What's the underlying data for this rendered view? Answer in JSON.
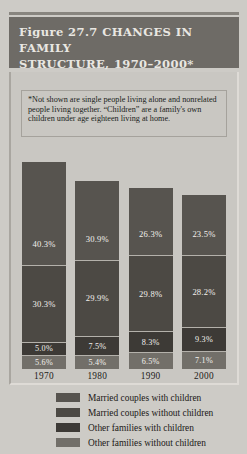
{
  "figure": {
    "title_line1": "Figure 27.7  CHANGES IN FAMILY",
    "title_line2": "STRUCTURE, 1970–2000*",
    "footnote": "*Not shown are single people living alone and nonrelated people living together. “Children” are a family's own children under age eighteen living at home."
  },
  "colors": {
    "banner": "#6e6b66",
    "panel_background": "#c9c7c2",
    "page_background": "#cdcbc6",
    "series_0": "#57544f",
    "series_1": "#4c4944",
    "series_2": "#3d3a36",
    "series_3": "#726f69"
  },
  "legend": {
    "items": [
      {
        "label": "Married couples with children",
        "swatch": "#57544f"
      },
      {
        "label": "Married couples without children",
        "swatch": "#4c4944"
      },
      {
        "label": "Other families with children",
        "swatch": "#3d3a36"
      },
      {
        "label": "Other families without children",
        "swatch": "#726f69"
      }
    ]
  },
  "chart_data": {
    "type": "bar",
    "title": "Figure 27.7  CHANGES IN FAMILY STRUCTURE, 1970–2000*",
    "xlabel": "",
    "ylabel": "",
    "ylim": [
      0,
      100
    ],
    "grid": false,
    "stacked": true,
    "legend_position": "bottom",
    "categories": [
      "1970",
      "1980",
      "1990",
      "2000"
    ],
    "series": [
      {
        "name": "Married couples with children",
        "values": [
          40.3,
          30.9,
          26.3,
          23.5
        ],
        "labels": [
          "40.3%",
          "30.9%",
          "26.3%",
          "23.5%"
        ]
      },
      {
        "name": "Married couples without children",
        "values": [
          30.3,
          29.9,
          29.8,
          28.2
        ],
        "labels": [
          "30.3%",
          "29.9%",
          "29.8%",
          "28.2%"
        ]
      },
      {
        "name": "Other families with children",
        "values": [
          5.0,
          7.5,
          8.3,
          9.3
        ],
        "labels": [
          "5.0%",
          "7.5%",
          "8.3%",
          "9.3%"
        ]
      },
      {
        "name": "Other families without children",
        "values": [
          5.6,
          5.4,
          6.5,
          7.1
        ],
        "labels": [
          "5.6%",
          "5.4%",
          "6.5%",
          "7.1%"
        ]
      }
    ]
  }
}
